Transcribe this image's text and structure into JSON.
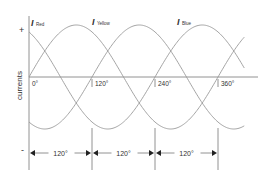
{
  "chart_data": {
    "type": "line",
    "title": "",
    "ylabel": "currents",
    "y_top_label": "+",
    "y_bottom_label": "-",
    "xlim_deg": [
      0,
      410
    ],
    "ylim": [
      -1,
      1
    ],
    "x_tick_labels": [
      "0°",
      "120°",
      "240°",
      "360°"
    ],
    "x_ticks_deg": [
      0,
      120,
      240,
      360
    ],
    "series": [
      {
        "name": "Red",
        "label_symbol": "I",
        "label_sub": "Red",
        "phase_deg": 120,
        "amplitude": 1
      },
      {
        "name": "Yellow",
        "label_symbol": "I",
        "label_sub": "Yellow",
        "phase_deg": 0,
        "amplitude": 1
      },
      {
        "name": "Blue",
        "label_symbol": "I",
        "label_sub": "Blue",
        "phase_deg": -120,
        "amplitude": 1
      }
    ],
    "spacing_arrows": [
      {
        "from_deg": 0,
        "to_deg": 120,
        "label": "120°"
      },
      {
        "from_deg": 120,
        "to_deg": 240,
        "label": "120°"
      },
      {
        "from_deg": 240,
        "to_deg": 360,
        "label": "120°"
      }
    ],
    "grid": false,
    "legend": "inline-labels-top"
  }
}
